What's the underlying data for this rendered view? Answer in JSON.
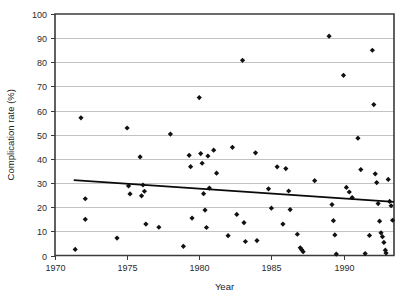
{
  "chart_data": {
    "type": "scatter",
    "title": "",
    "xlabel": "Year",
    "ylabel": "Complication rate (%)",
    "xlim": [
      1970,
      1993.5
    ],
    "ylim": [
      0,
      100
    ],
    "xticks": [
      1970,
      1975,
      1980,
      1985,
      1990
    ],
    "yticks": [
      0,
      10,
      20,
      30,
      40,
      50,
      60,
      70,
      80,
      90,
      100
    ],
    "xtick_labels": [
      "1970",
      "1975",
      "1980",
      "1985",
      "1990"
    ],
    "ytick_labels": [
      "0",
      "10",
      "20",
      "30",
      "40",
      "50",
      "60",
      "70",
      "80",
      "90",
      "100"
    ],
    "grid": "horizontal",
    "legend": "none",
    "marker": "filled-diamond",
    "marker_color": "#111111",
    "points": [
      [
        1971.4,
        2.5
      ],
      [
        1971.8,
        57.0
      ],
      [
        1972.1,
        23.5
      ],
      [
        1972.1,
        15.0
      ],
      [
        1974.3,
        7.2
      ],
      [
        1975.0,
        52.8
      ],
      [
        1975.1,
        28.8
      ],
      [
        1975.2,
        25.5
      ],
      [
        1975.9,
        40.8
      ],
      [
        1976.0,
        24.7
      ],
      [
        1976.1,
        29.2
      ],
      [
        1976.2,
        26.6
      ],
      [
        1976.3,
        13.0
      ],
      [
        1977.2,
        11.7
      ],
      [
        1978.0,
        50.3
      ],
      [
        1978.9,
        3.8
      ],
      [
        1979.3,
        41.5
      ],
      [
        1979.4,
        36.8
      ],
      [
        1979.5,
        15.5
      ],
      [
        1980.0,
        65.4
      ],
      [
        1980.1,
        42.2
      ],
      [
        1980.2,
        38.2
      ],
      [
        1980.3,
        25.6
      ],
      [
        1980.4,
        18.8
      ],
      [
        1980.5,
        11.6
      ],
      [
        1980.6,
        41.2
      ],
      [
        1980.7,
        27.9
      ],
      [
        1981.0,
        43.6
      ],
      [
        1981.2,
        34.1
      ],
      [
        1982.0,
        8.2
      ],
      [
        1982.3,
        44.8
      ],
      [
        1982.6,
        17.0
      ],
      [
        1983.0,
        80.8
      ],
      [
        1983.1,
        13.6
      ],
      [
        1983.2,
        5.8
      ],
      [
        1983.9,
        42.5
      ],
      [
        1984.0,
        6.2
      ],
      [
        1984.8,
        27.6
      ],
      [
        1985.0,
        19.6
      ],
      [
        1985.4,
        36.7
      ],
      [
        1985.8,
        13.0
      ],
      [
        1986.0,
        36.0
      ],
      [
        1986.2,
        26.7
      ],
      [
        1986.3,
        19.0
      ],
      [
        1986.8,
        8.8
      ],
      [
        1987.0,
        3.2
      ],
      [
        1987.1,
        2.4
      ],
      [
        1987.2,
        1.6
      ],
      [
        1988.0,
        31.0
      ],
      [
        1989.0,
        90.8
      ],
      [
        1989.2,
        21.1
      ],
      [
        1989.3,
        14.4
      ],
      [
        1989.4,
        8.5
      ],
      [
        1989.5,
        0.6
      ],
      [
        1990.0,
        74.6
      ],
      [
        1990.2,
        28.2
      ],
      [
        1990.4,
        26.3
      ],
      [
        1990.6,
        24.0
      ],
      [
        1991.0,
        48.6
      ],
      [
        1991.2,
        35.6
      ],
      [
        1991.5,
        0.8
      ],
      [
        1991.8,
        8.3
      ],
      [
        1992.0,
        85.0
      ],
      [
        1992.1,
        62.5
      ],
      [
        1992.2,
        33.8
      ],
      [
        1992.3,
        30.2
      ],
      [
        1992.4,
        21.5
      ],
      [
        1992.5,
        14.2
      ],
      [
        1992.6,
        9.4
      ],
      [
        1992.7,
        7.8
      ],
      [
        1992.8,
        5.4
      ],
      [
        1992.9,
        2.2
      ],
      [
        1992.95,
        1.0
      ],
      [
        1993.1,
        31.5
      ],
      [
        1993.2,
        22.4
      ],
      [
        1993.3,
        20.6
      ],
      [
        1993.4,
        14.6
      ]
    ],
    "trend_line": {
      "x_start": 1971.3,
      "y_start": 31.2,
      "x_end": 1993.5,
      "y_end": 22.2
    }
  }
}
